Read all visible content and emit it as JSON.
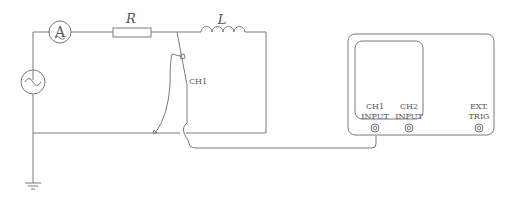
{
  "diagram": {
    "type": "circuit",
    "components": {
      "ammeter": {
        "symbol": "A"
      },
      "resistor": {
        "label": "R"
      },
      "inductor": {
        "label": "L"
      },
      "ac_source": {
        "symbol": "~"
      },
      "probe": {
        "label": "CH1"
      },
      "ground": {
        "symbol": "ground"
      }
    },
    "oscilloscope": {
      "inputs": [
        {
          "line1": "CH1",
          "line2": "INPUT"
        },
        {
          "line1": "CH2",
          "line2": "INPUT"
        },
        {
          "line1": "EXT.",
          "line2": "TRIG"
        }
      ]
    }
  }
}
